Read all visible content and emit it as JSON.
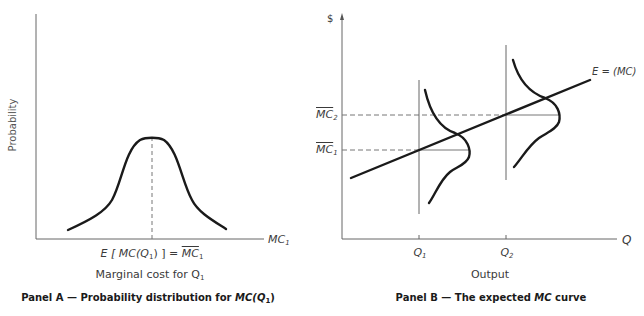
{
  "panel_a": {
    "y_axis_label": "Probability",
    "x_axis_label": "MC",
    "x_axis_label_sub": "1",
    "mean_label_lhs": "E [ MC(Q",
    "mean_label_lhs_sub": "1",
    "mean_label_mid": ") ] = ",
    "mean_label_rhs": "MC",
    "mean_label_rhs_sub": "1",
    "x_title": "Marginal cost for Q",
    "x_title_sub": "1",
    "caption_pre": "Panel A — Probability distribution for ",
    "caption_it": "MC(Q",
    "caption_sub": "1",
    "caption_post": ")"
  },
  "panel_b": {
    "y_axis_label": "$",
    "x_axis_label": "Q",
    "mc2_label": "MC",
    "mc2_sub": "2",
    "mc1_label": "MC",
    "mc1_sub": "1",
    "q1_label": "Q",
    "q1_sub": "1",
    "q2_label": "Q",
    "q2_sub": "2",
    "curve_label": "E = (MC)",
    "x_title": "Output",
    "caption_pre": "Panel B — The expected ",
    "caption_it": "MC",
    "caption_post": " curve"
  },
  "colors": {
    "axis": "#555555",
    "curve": "#1a1a1a",
    "dashed": "#666666"
  }
}
